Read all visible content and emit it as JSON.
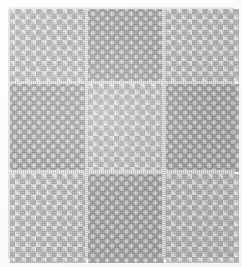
{
  "image": {
    "subject": "woven fabric swatch",
    "description": "Grayscale close-up photograph of a woven cotton cloth arranged as a three-by-three grid of alternating weave blocks",
    "width_px": 242,
    "height_px": 267,
    "color_mode": "grayscale"
  },
  "cloth": {
    "grid_rows": 3,
    "grid_columns": 3,
    "seam_color": "#cfcfcf",
    "base_color": "#b9b9b9",
    "background_color": "#fcfcfc",
    "blocks": [
      {
        "position": "top-left",
        "pattern": "checkerboard",
        "tone": "light",
        "light_color": "#f3f3f3",
        "dark_color": "#a8a8a8",
        "cell_size_px": 5
      },
      {
        "position": "top-center",
        "pattern": "damask-floral",
        "tone": "dark",
        "light_color": "#e2e2e2",
        "dark_color": "#a5a5a5",
        "motif_size_px": 10
      },
      {
        "position": "top-right",
        "pattern": "checkerboard",
        "tone": "light",
        "light_color": "#f3f3f3",
        "dark_color": "#a8a8a8",
        "cell_size_px": 5
      },
      {
        "position": "middle-left",
        "pattern": "damask-floral",
        "tone": "dark",
        "light_color": "#e2e2e2",
        "dark_color": "#9f9f9f",
        "motif_size_px": 10
      },
      {
        "position": "middle-center",
        "pattern": "checkerboard",
        "tone": "light",
        "light_color": "#f3f3f3",
        "dark_color": "#a8a8a8",
        "cell_size_px": 5
      },
      {
        "position": "middle-right",
        "pattern": "damask-floral",
        "tone": "dark",
        "light_color": "#e2e2e2",
        "dark_color": "#a5a5a5",
        "motif_size_px": 10
      },
      {
        "position": "bottom-left",
        "pattern": "checkerboard",
        "tone": "light",
        "light_color": "#f3f3f3",
        "dark_color": "#a8a8a8",
        "cell_size_px": 5
      },
      {
        "position": "bottom-center",
        "pattern": "damask-floral",
        "tone": "dark",
        "light_color": "#e2e2e2",
        "dark_color": "#a5a5a5",
        "motif_size_px": 10
      },
      {
        "position": "bottom-right",
        "pattern": "checkerboard",
        "tone": "light",
        "light_color": "#f3f3f3",
        "dark_color": "#a8a8a8",
        "cell_size_px": 5
      }
    ],
    "seams": [
      {
        "orientation": "horizontal",
        "index": 1
      },
      {
        "orientation": "horizontal",
        "index": 2
      },
      {
        "orientation": "vertical",
        "index": 1
      },
      {
        "orientation": "vertical",
        "index": 2
      }
    ]
  }
}
